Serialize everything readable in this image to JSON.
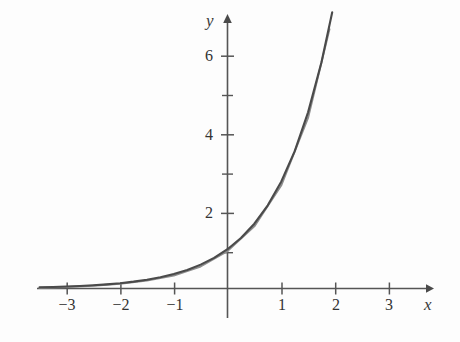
{
  "figure": {
    "background_color": "#fdfdfd",
    "curve_color": "#4a4a4a",
    "approximation_color": "#8d8d8d",
    "axis_color": "#555555",
    "width": 460,
    "height": 342
  },
  "axes": {
    "x_axis_label": "x",
    "y_axis_label": "y",
    "x_ticks": [
      {
        "label": "−3",
        "value": -3
      },
      {
        "label": "−2",
        "value": -2
      },
      {
        "label": "−1",
        "value": -1
      },
      {
        "label": "1",
        "value": 1
      },
      {
        "label": "2",
        "value": 2
      },
      {
        "label": "3",
        "value": 3
      }
    ],
    "y_ticks": [
      {
        "label": "2",
        "value": 2
      },
      {
        "label": "4",
        "value": 4
      },
      {
        "label": "6",
        "value": 6
      }
    ],
    "y_minor_ticks": [
      1,
      3,
      5
    ],
    "x_arrow": true,
    "y_arrow": true
  },
  "chart_data": {
    "type": "line",
    "title": "",
    "xlabel": "x",
    "ylabel": "y",
    "xlim": [
      -3.6,
      3.6
    ],
    "ylim": [
      -0.35,
      7.4
    ],
    "grid": false,
    "legend": "none",
    "x_tick_labels": [
      "−3",
      "−2",
      "−1",
      "1",
      "2",
      "3"
    ],
    "x_tick_values": [
      -3,
      -2,
      -1,
      1,
      2,
      3
    ],
    "y_tick_labels": [
      "2",
      "4",
      "6"
    ],
    "y_tick_values": [
      2,
      4,
      6
    ],
    "y_minor_tick_values": [
      1,
      3,
      5
    ],
    "series": [
      {
        "name": "y = e^x",
        "formula": "exp(x)",
        "color": "#4a4a4a",
        "x": [
          -3.5,
          -3.25,
          -3.0,
          -2.75,
          -2.5,
          -2.25,
          -2.0,
          -1.75,
          -1.5,
          -1.25,
          -1.0,
          -0.75,
          -0.5,
          -0.25,
          0.0,
          0.25,
          0.5,
          0.75,
          1.0,
          1.25,
          1.5,
          1.75,
          1.95
        ],
        "values": [
          0.03,
          0.039,
          0.05,
          0.064,
          0.082,
          0.105,
          0.135,
          0.174,
          0.223,
          0.287,
          0.368,
          0.472,
          0.607,
          0.779,
          1.0,
          1.284,
          1.649,
          2.117,
          2.718,
          3.49,
          4.482,
          5.755,
          7.029
        ]
      },
      {
        "name": "approximation",
        "formula": "exp(x) offset",
        "color": "#8d8d8d",
        "x": [
          -3.5,
          -3.0,
          -2.5,
          -2.0,
          -1.5,
          -1.0,
          -0.5,
          0.0,
          0.5,
          1.0,
          1.5,
          1.9
        ],
        "values": [
          0.02,
          0.04,
          0.07,
          0.12,
          0.2,
          0.33,
          0.56,
          0.95,
          1.58,
          2.62,
          4.34,
          6.6
        ]
      }
    ]
  }
}
